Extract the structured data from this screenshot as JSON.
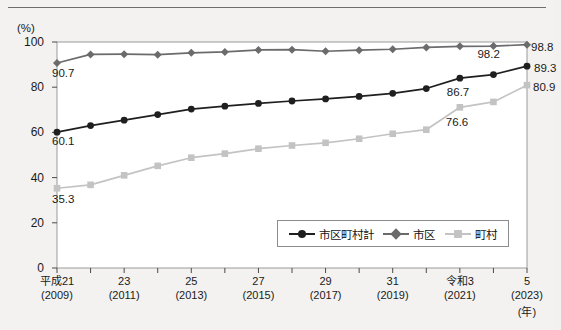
{
  "chart_data": {
    "type": "line",
    "title": "",
    "xlabel": "(年)",
    "ylabel": "(%)",
    "ylim": [
      0,
      100
    ],
    "yticks": [
      0,
      20,
      40,
      60,
      80,
      100
    ],
    "grid": false,
    "legend_position": "inside-bottom-right",
    "x": [
      2009,
      2010,
      2011,
      2012,
      2013,
      2014,
      2015,
      2016,
      2017,
      2018,
      2019,
      2020,
      2021,
      2022,
      2023
    ],
    "categories": [
      "平成21\n(2009)",
      "",
      "23\n(2011)",
      "",
      "25\n(2013)",
      "",
      "27\n(2015)",
      "",
      "29\n(2017)",
      "",
      "31\n(2019)",
      "",
      "令和3\n(2021)",
      "",
      "5\n(2023)"
    ],
    "tick_labels": [
      {
        "index": 0,
        "line1": "平成21",
        "line2": "(2009)"
      },
      {
        "index": 2,
        "line1": "23",
        "line2": "(2011)"
      },
      {
        "index": 4,
        "line1": "25",
        "line2": "(2013)"
      },
      {
        "index": 6,
        "line1": "27",
        "line2": "(2015)"
      },
      {
        "index": 8,
        "line1": "29",
        "line2": "(2017)"
      },
      {
        "index": 10,
        "line1": "31",
        "line2": "(2019)"
      },
      {
        "index": 12,
        "line1": "令和3",
        "line2": "(2021)"
      },
      {
        "index": 14,
        "line1": "5",
        "line2": "(2023)"
      }
    ],
    "series": [
      {
        "name": "市区町村計",
        "key": "total",
        "color": "#1f1f1f",
        "marker": "circle",
        "values": [
          60.1,
          63.0,
          65.4,
          67.9,
          70.3,
          71.6,
          72.8,
          73.9,
          74.8,
          75.9,
          77.3,
          79.4,
          84.0,
          85.6,
          89.3
        ],
        "labels": [
          {
            "index": 0,
            "text": "60.1"
          },
          {
            "index": 12,
            "text": "86.7"
          },
          {
            "index": 14,
            "text": "89.3"
          }
        ]
      },
      {
        "name": "市区",
        "key": "city",
        "color": "#6b6b6b",
        "marker": "diamond",
        "values": [
          90.7,
          94.5,
          94.6,
          94.4,
          95.2,
          95.6,
          96.5,
          96.6,
          95.9,
          96.4,
          96.8,
          97.6,
          98.1,
          98.2,
          98.8
        ],
        "labels": [
          {
            "index": 0,
            "text": "90.7"
          },
          {
            "index": 13,
            "text": "98.2"
          },
          {
            "index": 14,
            "text": "98.8"
          }
        ]
      },
      {
        "name": "町村",
        "key": "town",
        "color": "#c3c3c3",
        "marker": "square",
        "values": [
          35.3,
          36.8,
          41.0,
          45.2,
          48.8,
          50.6,
          52.8,
          54.2,
          55.4,
          57.2,
          59.4,
          61.2,
          71.1,
          73.5,
          80.9
        ],
        "labels": [
          {
            "index": 0,
            "text": "35.3"
          },
          {
            "index": 12,
            "text": "76.6"
          },
          {
            "index": 14,
            "text": "80.9"
          }
        ]
      }
    ],
    "value_labels_visible": [
      "90.7",
      "60.1",
      "35.3",
      "98.2",
      "98.8",
      "86.7",
      "89.3",
      "76.6",
      "80.9"
    ]
  },
  "legend": {
    "items": [
      {
        "label": "市区町村計",
        "marker": "circle",
        "color": "#1f1f1f"
      },
      {
        "label": "市区",
        "marker": "diamond",
        "color": "#6b6b6b"
      },
      {
        "label": "町村",
        "marker": "square",
        "color": "#c3c3c3"
      }
    ]
  },
  "axes": {
    "y_unit": "(%)",
    "x_unit": "(年)"
  }
}
